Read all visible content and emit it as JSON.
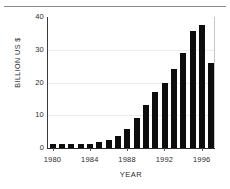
{
  "chart_data": {
    "type": "bar",
    "title": "",
    "xlabel": "YEAR",
    "ylabel": "BILLION US $",
    "categories": [
      "1980",
      "1981",
      "1982",
      "1983",
      "1984",
      "1985",
      "1986",
      "1987",
      "1988",
      "1989",
      "1990",
      "1991",
      "1992",
      "1993",
      "1994",
      "1995",
      "1996",
      "1997"
    ],
    "values": [
      1.2,
      1.1,
      1.1,
      1.2,
      1.3,
      1.7,
      2.3,
      3.7,
      5.8,
      9.2,
      13.2,
      17.1,
      19.9,
      24.0,
      29.0,
      35.6,
      37.5,
      25.9
    ],
    "xlim": [
      1979.5,
      1997.5
    ],
    "ylim": [
      0,
      40
    ],
    "yticks": [
      "0",
      "10",
      "20",
      "30",
      "40"
    ],
    "ytick_values": [
      0,
      10,
      20,
      30,
      40
    ],
    "xticks": [
      "1980",
      "1984",
      "1988",
      "1992",
      "1996"
    ],
    "xtick_values": [
      1980,
      1984,
      1988,
      1992,
      1996
    ],
    "grid": true,
    "grid_axis": "y",
    "legend": null,
    "bar_color": "#0d0d0d",
    "axis_color": "#2a2a2a",
    "grid_color": "#ececec",
    "background_color": "#ffffff"
  }
}
